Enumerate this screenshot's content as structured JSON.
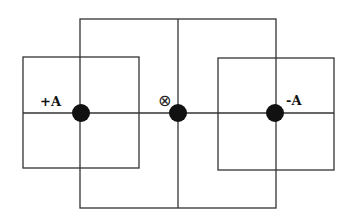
{
  "diagram": {
    "labels": {
      "left": "+A",
      "center": "⊗",
      "right": "-A"
    },
    "colors": {
      "line": "#333333",
      "dot": "#111111",
      "background": "#ffffff"
    }
  }
}
